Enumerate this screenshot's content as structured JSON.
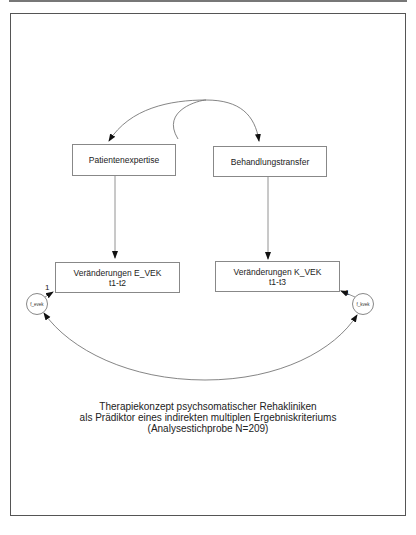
{
  "diagram": {
    "nodes": {
      "patientenexpertise": "Patientenexpertise",
      "behandlungstransfer": "Behandlungstransfer",
      "e_vek_line1": "Veränderungen E_VEK",
      "e_vek_line2": "t1-t2",
      "k_vek_line1": "Veränderungen K_VEK",
      "k_vek_line2": "t1-t3"
    },
    "errors": {
      "f_evek": "f_evek",
      "f_kvek": "f_kvek"
    },
    "path_labels": {
      "e_error_weight": "1",
      "k_error_weight": "1"
    },
    "caption": {
      "line1": "Therapiekonzept psychsomatischer Rehakliniken",
      "line2": "als Prädiktor eines indirekten multiplen Ergebniskriteriums",
      "line3": "(Analysestichprobe N=209)"
    }
  }
}
